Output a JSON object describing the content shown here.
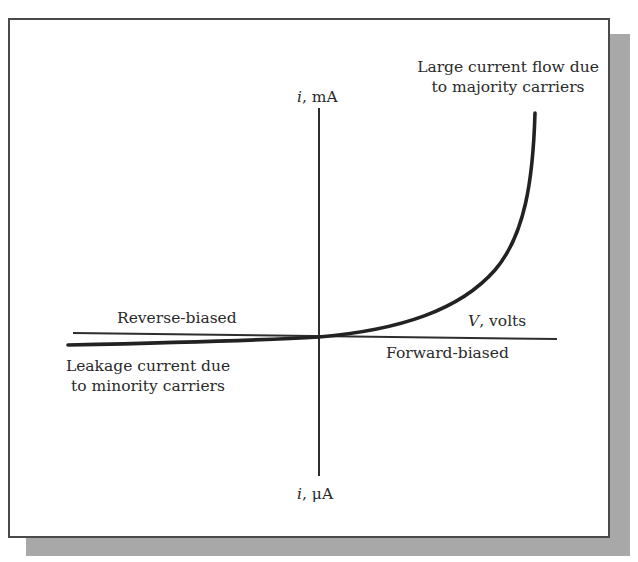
{
  "figure": {
    "type": "diode-iv-characteristic",
    "y_axis_top_label": {
      "var": "i",
      "unit": ", mA"
    },
    "y_axis_bottom_label": {
      "var": "i",
      "unit": ", μA"
    },
    "x_axis_label": {
      "var": "V",
      "unit": ", volts"
    },
    "region_labels": {
      "reverse": "Reverse-biased",
      "forward": "Forward-biased"
    },
    "annotations": {
      "forward_current": [
        "Large current flow due",
        "to majority carriers"
      ],
      "leakage_current": [
        "Leakage current due",
        "to minority carriers"
      ]
    },
    "colors": {
      "ink": "#2a2a2a",
      "frame": "#4a4a4a",
      "shadow": "#a8a8a8",
      "background": "#ffffff"
    }
  }
}
